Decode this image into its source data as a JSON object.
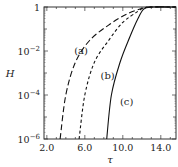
{
  "chart_data": {
    "type": "line",
    "title": "",
    "xlabel": "τ",
    "ylabel": "H",
    "xscale": "linear",
    "yscale": "log",
    "xlim": [
      1.7,
      15.6
    ],
    "ylim": [
      1e-06,
      1
    ],
    "x_ticks": [
      "2.0",
      "6.0",
      "10.0",
      "14.0"
    ],
    "y_ticks": [
      {
        "base": "1",
        "exp": ""
      },
      {
        "base": "10",
        "exp": "−2"
      },
      {
        "base": "10",
        "exp": "−4"
      },
      {
        "base": "10",
        "exp": "−6"
      }
    ],
    "series": [
      {
        "name": "(a)",
        "style": "long-dash",
        "points": [
          [
            3.4,
            1e-06
          ],
          [
            4.0,
            0.0001
          ],
          [
            5.0,
            0.003
          ],
          [
            6.5,
            0.03
          ],
          [
            8.5,
            0.15
          ],
          [
            10.5,
            0.5
          ],
          [
            12.2,
            0.9
          ],
          [
            13.0,
            1.0
          ],
          [
            15.6,
            1.0
          ]
        ]
      },
      {
        "name": "(b)",
        "style": "short-dash",
        "points": [
          [
            5.4,
            1e-06
          ],
          [
            6.0,
            0.0001
          ],
          [
            7.0,
            0.003
          ],
          [
            8.5,
            0.03
          ],
          [
            10.0,
            0.2
          ],
          [
            11.5,
            0.6
          ],
          [
            12.2,
            0.9
          ],
          [
            13.0,
            1.0
          ],
          [
            15.6,
            1.0
          ]
        ]
      },
      {
        "name": "(c)",
        "style": "solid",
        "points": [
          [
            8.3,
            1e-06
          ],
          [
            8.8,
            0.0001
          ],
          [
            9.7,
            0.003
          ],
          [
            10.7,
            0.04
          ],
          [
            11.6,
            0.3
          ],
          [
            12.2,
            0.8
          ],
          [
            13.0,
            1.0
          ],
          [
            15.6,
            1.0
          ]
        ]
      }
    ],
    "annotations": [
      {
        "text": "(a)",
        "x": 5.6,
        "y": 0.01
      },
      {
        "text": "(b)",
        "x": 8.4,
        "y": 0.0007
      },
      {
        "text": "(c)",
        "x": 10.4,
        "y": 5e-05
      }
    ],
    "grid": false,
    "legend": "none"
  }
}
